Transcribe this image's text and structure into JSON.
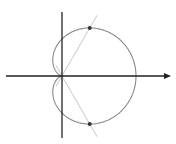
{
  "diagram": {
    "type": "polar-curve",
    "curve": "cardioid r = a(1 + cos θ)",
    "origin": [
      62,
      76
    ],
    "a": 37,
    "colors": {
      "axes": "#222222",
      "curve": "#888888",
      "ray": "#c8c8c8",
      "points": "#333333"
    },
    "axes": {
      "x": {
        "from": [
          6,
          76
        ],
        "to": [
          171,
          76
        ],
        "arrow": true
      },
      "y": {
        "from": [
          62,
          12
        ],
        "to": [
          62,
          138
        ],
        "arrow": false
      }
    },
    "ray_angle_deg": 60,
    "marked_points": [
      {
        "label": "",
        "theta_deg": 60,
        "xy": [
          90,
          28
        ]
      },
      {
        "label": "",
        "theta_deg": -60,
        "xy": [
          90,
          124
        ]
      }
    ]
  }
}
